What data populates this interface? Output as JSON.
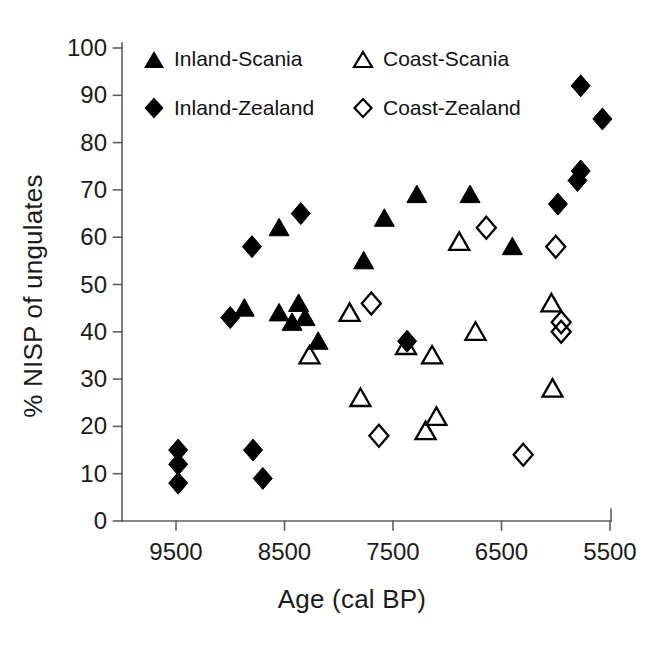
{
  "figure": {
    "background": "#ffffff",
    "text_color": "#1b1b1b",
    "axis_color": "#5f5f5f",
    "marker_color": "#000000"
  },
  "chart_data": {
    "type": "scatter",
    "title": "",
    "xlabel": "Age (cal BP)",
    "ylabel": "% NISP of ungulates",
    "x_ticks": [
      9500,
      8500,
      7500,
      6500,
      5500
    ],
    "y_ticks": [
      0,
      10,
      20,
      30,
      40,
      50,
      60,
      70,
      80,
      90,
      100
    ],
    "x_axis_reversed": true,
    "xlim": [
      9970,
      5480
    ],
    "ylim": [
      0,
      100
    ],
    "grid": false,
    "legend_position": "top-left two-column",
    "series": [
      {
        "name": "Inland-Scania",
        "marker": "triangle",
        "fill": "filled",
        "points": [
          [
            8870,
            45
          ],
          [
            8550,
            62
          ],
          [
            8550,
            44
          ],
          [
            8430,
            42
          ],
          [
            8370,
            46
          ],
          [
            8310,
            43
          ],
          [
            8190,
            38
          ],
          [
            7770,
            55
          ],
          [
            7580,
            64
          ],
          [
            7280,
            69
          ],
          [
            6790,
            69
          ],
          [
            6400,
            58
          ]
        ]
      },
      {
        "name": "Coast-Scania",
        "marker": "triangle",
        "fill": "open",
        "points": [
          [
            8270,
            35
          ],
          [
            7900,
            44
          ],
          [
            7800,
            26
          ],
          [
            7380,
            37
          ],
          [
            7200,
            19
          ],
          [
            7140,
            35
          ],
          [
            7100,
            22
          ],
          [
            6890,
            59
          ],
          [
            6740,
            40
          ],
          [
            6040,
            46
          ],
          [
            6030,
            28
          ]
        ]
      },
      {
        "name": "Inland-Zealand",
        "marker": "diamond",
        "fill": "filled",
        "points": [
          [
            9480,
            15
          ],
          [
            9480,
            12
          ],
          [
            9480,
            8
          ],
          [
            9000,
            43
          ],
          [
            8800,
            58
          ],
          [
            8790,
            15
          ],
          [
            8700,
            9
          ],
          [
            8350,
            65
          ],
          [
            7370,
            38
          ],
          [
            5980,
            67
          ],
          [
            5800,
            72
          ],
          [
            5770,
            74
          ],
          [
            5770,
            92
          ],
          [
            5570,
            85
          ]
        ]
      },
      {
        "name": "Coast-Zealand",
        "marker": "diamond",
        "fill": "open",
        "points": [
          [
            7700,
            46
          ],
          [
            7630,
            18
          ],
          [
            6640,
            62
          ],
          [
            6300,
            14
          ],
          [
            6000,
            58
          ],
          [
            5950,
            42
          ],
          [
            5950,
            40
          ]
        ]
      }
    ]
  }
}
